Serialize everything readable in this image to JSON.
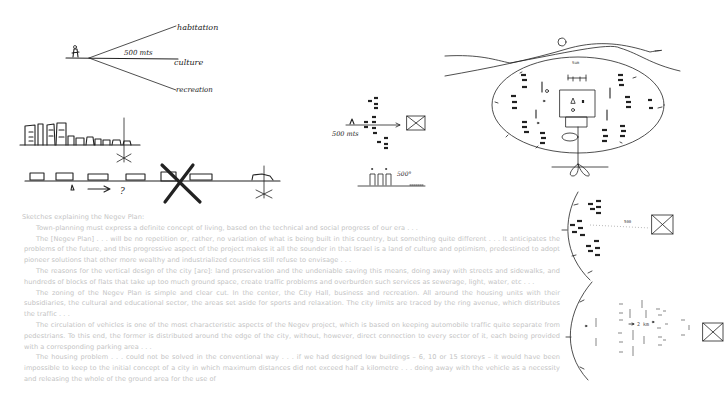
{
  "sketches": {
    "view_fan": {
      "labels": [
        "habitation",
        "500 mts",
        "culture",
        "recreation"
      ]
    },
    "skyline_compare": {
      "question_mark": "?"
    },
    "distance_plan": {
      "distance_label": "500 mts",
      "height_label": "500°"
    },
    "city_ring": {
      "hill_label": "Sum"
    },
    "partial_ring_a": {
      "distance_label": "500"
    },
    "partial_ring_b": {
      "distance_label": "2 km"
    }
  },
  "caption": {
    "title": "Sketches explaining the Negev Plan:",
    "paragraphs": [
      "Town-planning must express a definite concept of living, based on the technical and social progress of our era . . .",
      "The [Negev Plan] . . . will be no repetition or, rather, no variation of what is being built in this country, but something quite different . . . It anticipates the problems of the future, and this progressive aspect of the project makes it all the sounder in that Israel is a land of culture and optimism, predestined to adopt pioneer solutions that other more wealthy and industrialized countries still refuse to envisage . . .",
      "The reasons for the vertical design of the city [are]: land preservation and the undeniable saving this means, doing away with streets and sidewalks, and hundreds of blocks of flats that take up too much ground space, create traffic problems and overburden such services as sewerage, light, water, etc . . .",
      "The zoning of the Negev Plan is simple and clear cut. In the center, the City Hall, business and recreation. All around the housing units with their subsidiaries, the cultural and educational sector, the areas set aside for sports and relaxation. The city limits are traced by the ring avenue, which distributes the traffic . . .",
      "The circulation of vehicles is one of the most characteristic aspects of the Negev project, which is based on keeping automobile traffic quite separate from pedestrians. To this end, the former is distributed around the edge of the city, without, however, direct connection to every sector of it, each being provided with a corresponding parking area . . .",
      "The housing problem . . . could not be solved in the conventional way . . . if we had designed low buildings – 6, 10 or 15 storeys – it would have been impossible to keep to the initial concept of a city in which maximum distances did not exceed half a kilometre . . . doing away with the vehicle as a necessity and releasing the whole of the ground area for the use of"
    ]
  },
  "colors": {
    "ink": "#222222",
    "caption_text": "#c4c4c4",
    "background": "#ffffff"
  }
}
